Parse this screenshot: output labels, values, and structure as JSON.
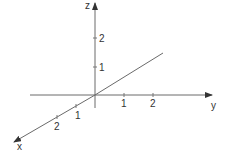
{
  "diagram": {
    "type": "3d-coordinate-axes",
    "axes": {
      "x": {
        "label": "x",
        "ticks": [
          "1",
          "2"
        ]
      },
      "y": {
        "label": "y",
        "ticks": [
          "1",
          "2"
        ]
      },
      "z": {
        "label": "z",
        "ticks": [
          "1",
          "2"
        ]
      }
    },
    "line": {
      "description": "line through origin in the y-z direction"
    },
    "colors": {
      "axis": "#6a6a6a",
      "text": "#333333",
      "background": "#ffffff"
    }
  }
}
